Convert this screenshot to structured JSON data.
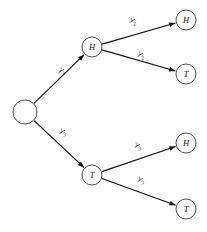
{
  "diagram": {
    "type": "probability-tree",
    "width": 207,
    "height": 232,
    "background_color": "#ffffff",
    "stroke_color": "#111111",
    "node_stroke_color": "#3a3a3a",
    "node_fill_color": "#ffffff"
  },
  "nodes": [
    {
      "id": "root",
      "label": "",
      "x": 25,
      "y": 112,
      "r": 12,
      "depth": 0
    },
    {
      "id": "h1",
      "label": "H",
      "x": 92,
      "y": 47,
      "r": 10,
      "depth": 1
    },
    {
      "id": "t1",
      "label": "T",
      "x": 92,
      "y": 175,
      "r": 10,
      "depth": 1
    },
    {
      "id": "hh",
      "label": "H",
      "x": 186,
      "y": 20,
      "r": 10,
      "depth": 2
    },
    {
      "id": "ht",
      "label": "T",
      "x": 186,
      "y": 74,
      "r": 10,
      "depth": 2
    },
    {
      "id": "th",
      "label": "H",
      "x": 186,
      "y": 143,
      "r": 10,
      "depth": 2
    },
    {
      "id": "tt",
      "label": "T",
      "x": 186,
      "y": 209,
      "r": 10,
      "depth": 2
    }
  ],
  "edges": [
    {
      "id": "root-h1",
      "from": "root",
      "to": "h1",
      "numerator": "2",
      "denominator": "3",
      "label_x": 62,
      "label_y": 72
    },
    {
      "id": "root-t1",
      "from": "root",
      "to": "t1",
      "numerator": "1",
      "denominator": "3",
      "label_x": 63,
      "label_y": 133
    },
    {
      "id": "h1-hh",
      "from": "h1",
      "to": "hh",
      "numerator": "1",
      "denominator": "2",
      "label_x": 133,
      "label_y": 22
    },
    {
      "id": "h1-ht",
      "from": "h1",
      "to": "ht",
      "numerator": "1",
      "denominator": "2",
      "label_x": 141,
      "label_y": 56
    },
    {
      "id": "t1-th",
      "from": "t1",
      "to": "th",
      "numerator": "2",
      "denominator": "3",
      "label_x": 138,
      "label_y": 147
    },
    {
      "id": "t1-tt",
      "from": "t1",
      "to": "tt",
      "numerator": "1",
      "denominator": "3",
      "label_x": 141,
      "label_y": 181
    }
  ]
}
